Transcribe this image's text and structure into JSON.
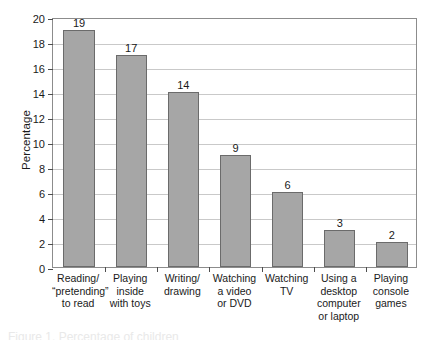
{
  "chart_data": {
    "type": "bar",
    "title": "",
    "subtitle": "",
    "xlabel": "",
    "ylabel": "Percentage",
    "ylim": [
      0,
      20
    ],
    "ytick_values": [
      0,
      2,
      4,
      6,
      8,
      10,
      12,
      14,
      16,
      18,
      20
    ],
    "ytick_labels": [
      "0",
      "2",
      "4",
      "6",
      "8",
      "10",
      "12",
      "14",
      "16",
      "18",
      "20"
    ],
    "grid": true,
    "legend": false,
    "legend_position": "none",
    "value_labels": true,
    "categories": [
      "Reading/\n“pretending”\nto read",
      "Playing\ninside\nwith toys",
      "Writing/\ndrawing",
      "Watching\na video\nor DVD",
      "Watching\nTV",
      "Using a\ndesktop\ncomputer\nor laptop",
      "Playing\nconsole\ngames"
    ],
    "values": [
      19,
      17,
      14,
      9,
      6,
      3,
      2
    ],
    "value_label_texts": [
      "19",
      "17",
      "14",
      "9",
      "6",
      "3",
      "2"
    ],
    "colors": {
      "bar_fill": "#a6a6a6",
      "bar_border": "#6b6b6b",
      "gridline": "#c9c9c9",
      "axis": "#8c8c8c",
      "tick": "#4d4d4d",
      "text": "#1a1a1a",
      "background": "#ffffff"
    }
  },
  "caption": {
    "cut_off_text": "Figure 1. Percentage of children"
  }
}
